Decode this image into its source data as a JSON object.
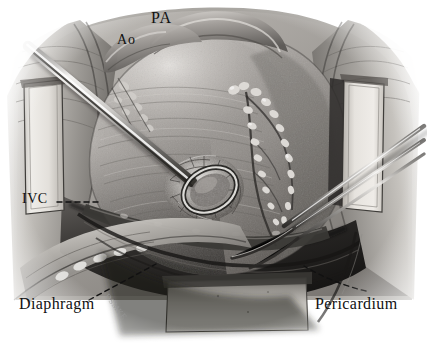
{
  "figure": {
    "type": "medical-illustration",
    "medium": "graphite / carbon dust drawing",
    "palette": {
      "background": "#ffffff",
      "ink": "#111111",
      "tissue_light": "#b9b7b4",
      "tissue_mid": "#8d8a87",
      "tissue_dark": "#4a4846",
      "shadow": "#211f1e",
      "metal_light": "#e8e8e6",
      "metal_mid": "#9c9c99",
      "metal_dark": "#3a3a38",
      "retractor_blade": "#dedbd6",
      "leader_line": "#1a1a1a"
    }
  },
  "labels": {
    "pa": "PA",
    "ao": "Ao",
    "ivc": "IVC",
    "diaphragm": "Diaphragm",
    "pericardium": "Pericardium",
    "signature": "DSMKE"
  },
  "structures": [
    {
      "name": "pulmonary-artery",
      "abbrev": "PA",
      "position": "top-center"
    },
    {
      "name": "aorta",
      "abbrev": "Ao",
      "position": "top-left-of-center"
    },
    {
      "name": "inferior-vena-cava",
      "abbrev": "IVC",
      "position": "left-mid"
    },
    {
      "name": "diaphragm",
      "abbrev": "Diaphragm",
      "position": "bottom-left"
    },
    {
      "name": "pericardium",
      "abbrev": "Pericardium",
      "position": "bottom-right"
    },
    {
      "name": "heart-ventricle-mass",
      "abbrev": "",
      "position": "center"
    },
    {
      "name": "coronary-vessels-with-epicardial-fat",
      "abbrev": "",
      "position": "center-right"
    }
  ],
  "instruments": [
    {
      "name": "suction-cannula",
      "position": "upper-left-to-center",
      "tip": "oval-ring-tip"
    },
    {
      "name": "forceps",
      "position": "right-edge-diagonal"
    },
    {
      "name": "retractor-blade-left",
      "position": "left"
    },
    {
      "name": "retractor-blade-right",
      "position": "right"
    },
    {
      "name": "retractor-blade-bottom",
      "position": "bottom-center"
    }
  ]
}
